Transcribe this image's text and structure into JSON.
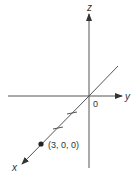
{
  "diagram": {
    "type": "3d-coordinate-axes",
    "axes": {
      "x": {
        "label": "x"
      },
      "y": {
        "label": "y"
      },
      "z": {
        "label": "z"
      }
    },
    "origin_label": "0",
    "point": {
      "label": "(3, 0, 0)",
      "coords": [
        3,
        0,
        0
      ]
    },
    "x_axis_ticks": 2,
    "colors": {
      "line": "#444444",
      "text": "#333333"
    }
  }
}
